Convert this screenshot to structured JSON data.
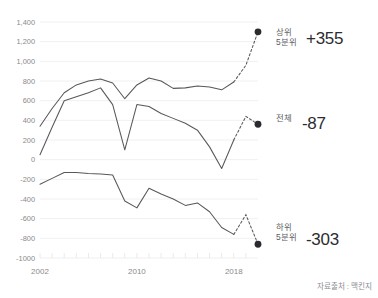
{
  "source_note": "자료출처 : 맥킨지",
  "annotations": [
    {
      "name": "top-quintile",
      "label_line1": "상위",
      "label_line2": "5분위",
      "value": "+355"
    },
    {
      "name": "total",
      "label_line1": "전체",
      "label_line2": "",
      "value": "-87"
    },
    {
      "name": "bottom-quintile",
      "label_line1": "하위",
      "label_line2": "5분위",
      "value": "-303"
    }
  ],
  "chart_data": {
    "type": "line",
    "title": "",
    "xlabel": "",
    "ylabel": "",
    "ylim": [
      -1000,
      1400
    ],
    "xlim": [
      2002,
      2020
    ],
    "grid": true,
    "legend_position": "right-inline",
    "ytick_labels": [
      "1,400",
      "1,200",
      "1,000",
      "800",
      "600",
      "400",
      "200",
      "0",
      "-200",
      "-400",
      "-600",
      "-800",
      "-1000"
    ],
    "ytick_values": [
      1400,
      1200,
      1000,
      800,
      600,
      400,
      200,
      0,
      -200,
      -400,
      -600,
      -800,
      -1000
    ],
    "xtick_labels": [
      "2002",
      "2010",
      "2018"
    ],
    "xtick_values": [
      2002,
      2010,
      2018
    ],
    "x": [
      2002,
      2003,
      2004,
      2005,
      2006,
      2007,
      2008,
      2009,
      2010,
      2011,
      2012,
      2013,
      2014,
      2015,
      2016,
      2017,
      2018
    ],
    "series": [
      {
        "name": "상위 5분위",
        "end_value": 355,
        "values": [
          340,
          520,
          680,
          760,
          800,
          820,
          780,
          620,
          760,
          830,
          800,
          725,
          730,
          750,
          740,
          710,
          790
        ],
        "projection": {
          "x": [
            2018,
            2019,
            2020
          ],
          "values": [
            790,
            960,
            1300
          ]
        }
      },
      {
        "name": "전체",
        "end_value": -87,
        "values": [
          50,
          330,
          600,
          640,
          680,
          730,
          560,
          100,
          560,
          540,
          470,
          420,
          370,
          300,
          130,
          -90,
          200
        ],
        "projection": {
          "x": [
            2018,
            2019,
            2020
          ],
          "values": [
            200,
            440,
            360
          ]
        }
      },
      {
        "name": "하위 5분위",
        "end_value": -303,
        "values": [
          -250,
          -190,
          -130,
          -130,
          -140,
          -145,
          -155,
          -420,
          -490,
          -290,
          -350,
          -400,
          -465,
          -440,
          -530,
          -690,
          -760
        ],
        "projection": {
          "x": [
            2018,
            2019,
            2020
          ],
          "values": [
            -760,
            -560,
            -860
          ]
        }
      }
    ]
  }
}
